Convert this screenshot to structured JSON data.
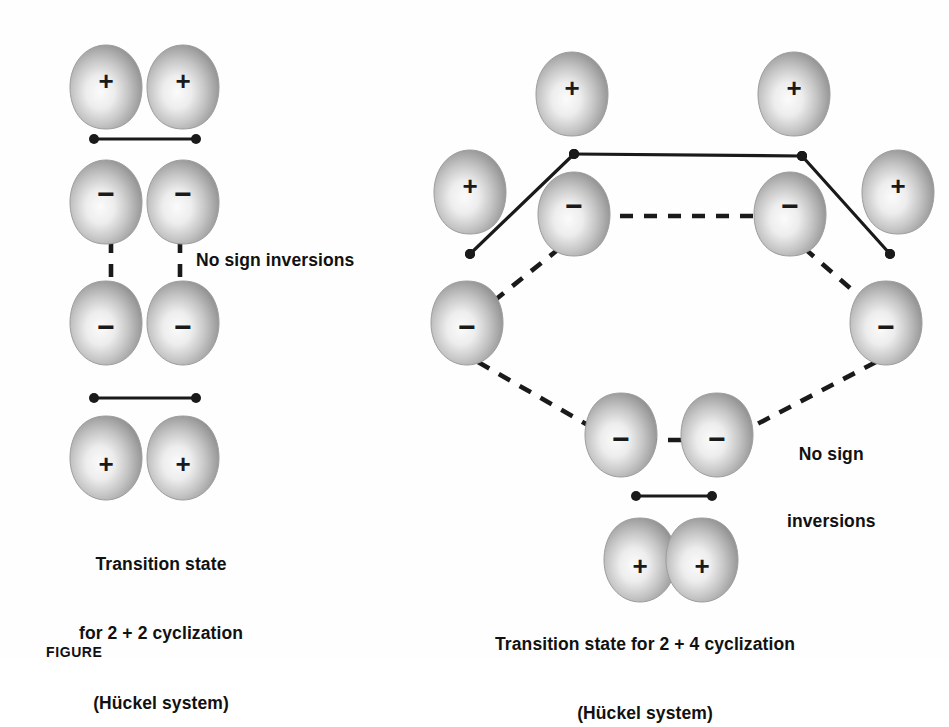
{
  "figure": {
    "tag": "FIGURE",
    "background_color": "#ffffff",
    "ink_color": "#1a1a1a",
    "lobe_edge_color": "#9a9a9a",
    "lobe_core_color": "#f2f2f2"
  },
  "left_diagram": {
    "name": "2 + 2 cyclization transition state",
    "annotation": "No sign inversions",
    "caption_line1": "Transition state",
    "caption_line2": "for 2 + 2 cyclization",
    "caption_line3": "(Hückel system)",
    "orbitals": [
      {
        "sign": "+",
        "orientation": "down",
        "x": 106,
        "y": 85
      },
      {
        "sign": "+",
        "orientation": "down",
        "x": 183,
        "y": 85
      },
      {
        "sign": "−",
        "orientation": "down",
        "x": 106,
        "y": 200
      },
      {
        "sign": "−",
        "orientation": "down",
        "x": 183,
        "y": 200
      },
      {
        "sign": "−",
        "orientation": "up",
        "x": 106,
        "y": 325
      },
      {
        "sign": "−",
        "orientation": "up",
        "x": 183,
        "y": 325
      },
      {
        "sign": "+",
        "orientation": "up",
        "x": 106,
        "y": 460
      },
      {
        "sign": "+",
        "orientation": "up",
        "x": 183,
        "y": 460
      }
    ],
    "bonds": [
      {
        "style": "solid",
        "x1": 94,
        "y1": 139,
        "x2": 196,
        "y2": 139
      },
      {
        "style": "dashed",
        "x1": 126,
        "y1": 205,
        "x2": 166,
        "y2": 205
      },
      {
        "style": "dashed",
        "x1": 111,
        "y1": 240,
        "x2": 111,
        "y2": 300
      },
      {
        "style": "dashed",
        "x1": 180,
        "y1": 240,
        "x2": 180,
        "y2": 300
      },
      {
        "style": "dashed",
        "x1": 126,
        "y1": 325,
        "x2": 166,
        "y2": 325
      },
      {
        "style": "solid",
        "x1": 94,
        "y1": 398,
        "x2": 196,
        "y2": 398
      }
    ]
  },
  "right_diagram": {
    "name": "2 + 4 cyclization transition state",
    "annotation_line1": "No sign",
    "annotation_line2": "inversions",
    "caption_line1": "Transition state for 2 + 4 cyclization",
    "caption_line2": "(Hückel system)",
    "orbitals": [
      {
        "sign": "+",
        "orientation": "down",
        "x": 572,
        "y": 92
      },
      {
        "sign": "+",
        "orientation": "down",
        "x": 794,
        "y": 92
      },
      {
        "sign": "+",
        "orientation": "down",
        "x": 470,
        "y": 190
      },
      {
        "sign": "+",
        "orientation": "down",
        "x": 898,
        "y": 190
      },
      {
        "sign": "−",
        "orientation": "down",
        "x": 574,
        "y": 212
      },
      {
        "sign": "−",
        "orientation": "down",
        "x": 790,
        "y": 212
      },
      {
        "sign": "−",
        "orientation": "up",
        "x": 467,
        "y": 325
      },
      {
        "sign": "−",
        "orientation": "up",
        "x": 886,
        "y": 325
      },
      {
        "sign": "−",
        "orientation": "up",
        "x": 621,
        "y": 437
      },
      {
        "sign": "−",
        "orientation": "up",
        "x": 717,
        "y": 437
      },
      {
        "sign": "+",
        "orientation": "up",
        "x": 640,
        "y": 562
      },
      {
        "sign": "+",
        "orientation": "up",
        "x": 702,
        "y": 562
      }
    ],
    "bonds": [
      {
        "style": "solid",
        "x1": 574,
        "y1": 154,
        "x2": 802,
        "y2": 156
      },
      {
        "style": "solid",
        "x1": 574,
        "y1": 154,
        "x2": 470,
        "y2": 254
      },
      {
        "style": "solid",
        "x1": 802,
        "y1": 156,
        "x2": 890,
        "y2": 254
      },
      {
        "style": "dashed",
        "x1": 596,
        "y1": 216,
        "x2": 768,
        "y2": 216
      },
      {
        "style": "dashed",
        "x1": 560,
        "y1": 248,
        "x2": 475,
        "y2": 316
      },
      {
        "style": "dashed",
        "x1": 804,
        "y1": 248,
        "x2": 882,
        "y2": 316
      },
      {
        "style": "dashed",
        "x1": 478,
        "y1": 362,
        "x2": 600,
        "y2": 432
      },
      {
        "style": "dashed",
        "x1": 876,
        "y1": 362,
        "x2": 742,
        "y2": 432
      },
      {
        "style": "dashed",
        "x1": 644,
        "y1": 440,
        "x2": 694,
        "y2": 440
      },
      {
        "style": "solid",
        "x1": 636,
        "y1": 496,
        "x2": 712,
        "y2": 496
      }
    ],
    "vertex_dots": [
      {
        "x": 574,
        "y": 154
      },
      {
        "x": 802,
        "y": 156
      },
      {
        "x": 470,
        "y": 254
      },
      {
        "x": 890,
        "y": 254
      }
    ]
  }
}
